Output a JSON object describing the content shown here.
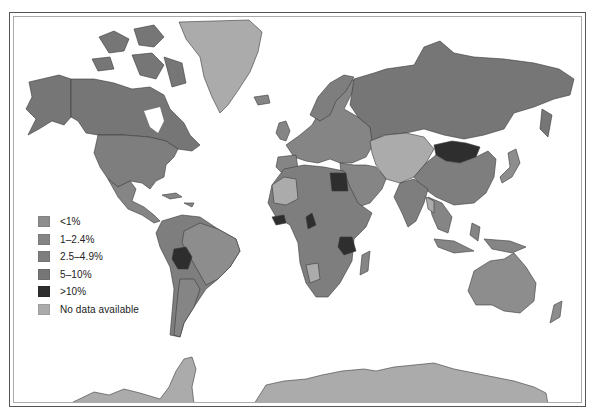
{
  "map": {
    "type": "choropleth",
    "projection": "mercator",
    "colors": {
      "lt1": "#8d8d8d",
      "1to2_4": "#858585",
      "2_5to4_9": "#7e7e7e",
      "5to10": "#767676",
      "gt10": "#2e2e2e",
      "no_data": "#ababab",
      "ocean": "#ffffff",
      "border": "#3a3a3a"
    },
    "highlighted_gt10": [
      "Mongolia",
      "Egypt",
      "Guinea",
      "Cameroon",
      "Tanzania",
      "Bolivia"
    ],
    "no_data_regions": [
      "Greenland",
      "Kazakhstan / Central Asia",
      "Mauritania/Mali region",
      "Namibia",
      "Antarctica",
      "Myanmar"
    ]
  },
  "legend": {
    "items": [
      {
        "label": "<1%",
        "color": "#8d8d8d"
      },
      {
        "label": "1–2.4%",
        "color": "#858585"
      },
      {
        "label": "2.5–4.9%",
        "color": "#7e7e7e"
      },
      {
        "label": "5–10%",
        "color": "#767676"
      },
      {
        "label": ">10%",
        "color": "#2e2e2e"
      },
      {
        "label": "No data available",
        "color": "#ababab"
      }
    ]
  }
}
